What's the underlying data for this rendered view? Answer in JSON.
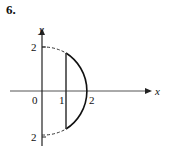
{
  "problem_number": "6.",
  "figure": {
    "axes": {
      "x_label": "x",
      "y_label": "y"
    },
    "tick_labels": {
      "origin": "0",
      "x1": "1",
      "x2": "2",
      "y_top": "2",
      "y_bottom": "2"
    },
    "region": "part of disk x^2 + y^2 <= 4 with 1 <= x <= 2",
    "curves": [
      {
        "name": "circle x^2+y^2=4 (dashed part)",
        "style": "dashed",
        "x_range": [
          0,
          1
        ]
      },
      {
        "name": "circle x^2+y^2=4 (solid arc)",
        "style": "solid",
        "x_range": [
          1,
          2
        ]
      },
      {
        "name": "vertical line x=1",
        "style": "solid"
      }
    ]
  }
}
